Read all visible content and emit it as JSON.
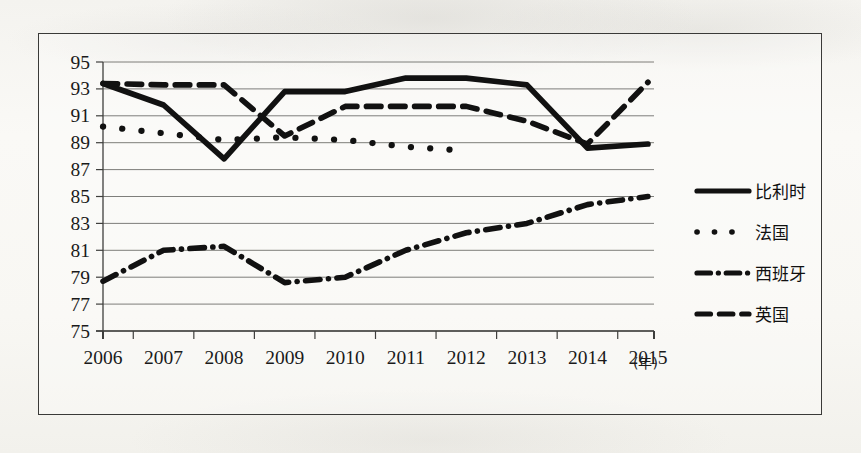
{
  "chart_data": {
    "type": "line",
    "title": "",
    "xlabel": "(年)",
    "ylabel": "",
    "grid": true,
    "legend_position": "right",
    "categories": [
      "2006",
      "2007",
      "2008",
      "2009",
      "2010",
      "2011",
      "2012",
      "2013",
      "2014",
      "2015"
    ],
    "x": [
      2006,
      2007,
      2008,
      2009,
      2010,
      2011,
      2012,
      2013,
      2014,
      2015
    ],
    "xlim": [
      2006,
      2015
    ],
    "ylim": [
      75,
      95
    ],
    "yticks": [
      75,
      77,
      79,
      81,
      83,
      85,
      87,
      89,
      91,
      93,
      95
    ],
    "xticks": [
      "2006",
      "2007",
      "2008",
      "2009",
      "2010",
      "2011",
      "2012",
      "2013",
      "2014",
      "2015"
    ],
    "series": [
      {
        "name": "比利时",
        "style": "solid",
        "values": [
          93.4,
          91.8,
          87.8,
          92.8,
          92.8,
          93.8,
          93.8,
          93.3,
          88.6,
          88.9
        ]
      },
      {
        "name": "法国",
        "style": "dotted",
        "values": [
          90.2,
          89.7,
          89.2,
          89.4,
          89.2,
          88.7,
          88.4,
          null,
          null,
          null
        ]
      },
      {
        "name": "西班牙",
        "style": "dashdot",
        "values": [
          78.7,
          81.0,
          81.3,
          78.6,
          79.0,
          81.0,
          82.3,
          83.0,
          84.4,
          85.0
        ]
      },
      {
        "name": "英国",
        "style": "dashed",
        "values": [
          93.4,
          93.3,
          93.3,
          89.5,
          91.7,
          91.7,
          91.7,
          90.6,
          88.9,
          93.5
        ]
      }
    ]
  },
  "legend": {
    "entries": [
      {
        "label": "比利时",
        "style": "solid"
      },
      {
        "label": "法国",
        "style": "dotted"
      },
      {
        "label": "西班牙",
        "style": "dashdot"
      },
      {
        "label": "英国",
        "style": "dashed"
      }
    ]
  },
  "colors": {
    "ink": "#111111",
    "grid": "#6f6f6c",
    "axis": "#3f3f3d",
    "paper": "#f7f6f3"
  }
}
